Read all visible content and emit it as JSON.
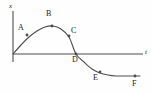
{
  "figure": {
    "background": "#fefefe",
    "ink": "#4d4d4d",
    "text_color": "#1a1a1a"
  },
  "axes": {
    "y_label": "x",
    "x_label": "t",
    "y_label_pos": {
      "x": 9,
      "y": 3
    },
    "x_label_pos": {
      "x": 145,
      "y": 49
    },
    "origin": {
      "x": 13,
      "y": 54
    },
    "x_axis_end": {
      "x": 143,
      "y": 54
    },
    "y_axis_top": {
      "x": 13,
      "y": 11
    },
    "y_axis_bottom": {
      "x": 13,
      "y": 62
    }
  },
  "chart_data": {
    "type": "line",
    "title": "",
    "xlabel": "t",
    "ylabel": "x",
    "grid": false,
    "legend": null,
    "x": [
      13,
      21,
      29,
      37,
      45,
      53,
      61,
      69,
      76,
      84,
      92,
      100,
      108,
      116,
      124,
      132,
      140
    ],
    "y": [
      54,
      45,
      37,
      31,
      27,
      26,
      29,
      37,
      54,
      62,
      69,
      73,
      75,
      76,
      76,
      76,
      76
    ],
    "annotations": [
      {
        "label": "A",
        "point": {
          "x": 27,
          "y": 35
        },
        "label_pos": {
          "x": 18,
          "y": 24
        }
      },
      {
        "label": "B",
        "point": {
          "x": 52,
          "y": 26
        },
        "label_pos": {
          "x": 46,
          "y": 10
        }
      },
      {
        "label": "C",
        "point": {
          "x": 69,
          "y": 36
        },
        "label_pos": {
          "x": 71,
          "y": 27
        }
      },
      {
        "label": "D",
        "point": {
          "x": 76,
          "y": 54
        },
        "label_pos": {
          "x": 72,
          "y": 56
        }
      },
      {
        "label": "E",
        "point": {
          "x": 100,
          "y": 72
        },
        "label_pos": {
          "x": 93,
          "y": 74
        }
      },
      {
        "label": "F",
        "point": {
          "x": 135,
          "y": 76
        },
        "label_pos": {
          "x": 132,
          "y": 80
        }
      }
    ]
  }
}
